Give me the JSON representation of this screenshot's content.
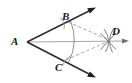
{
  "figure": {
    "background_color": "#ffffff",
    "width": 132,
    "height": 83,
    "stroke_color": "#2b2b2b",
    "construction_color": "#8a8a8a",
    "dashed_color": "#9a9a9a",
    "labels": {
      "vertex": "A",
      "upper_point": "B",
      "lower_point": "C",
      "intersection_point": "D"
    },
    "points": {
      "A": {
        "x": 27,
        "y": 42
      },
      "B": {
        "x": 68,
        "y": 22
      },
      "C": {
        "x": 66,
        "y": 60
      },
      "D": {
        "x": 109,
        "y": 40
      }
    },
    "rays": [
      {
        "name": "ray-AB",
        "from": "A",
        "through": "B",
        "tip_x": 95,
        "tip_y": 8,
        "arrow": true,
        "style": "solid"
      },
      {
        "name": "ray-AC",
        "from": "A",
        "through": "C",
        "tip_x": 95,
        "tip_y": 77,
        "arrow": true,
        "style": "solid"
      },
      {
        "name": "ray-AD-bisector",
        "from": "A",
        "through": "D",
        "tip_x": 129,
        "tip_y": 41,
        "arrow": true,
        "style": "solid-light"
      }
    ],
    "arcs": [
      {
        "name": "arc-BC-from-A",
        "description": "compass arc centered at A cutting the rays at B and C"
      },
      {
        "name": "arc-from-B",
        "description": "compass arc centered at B crossing near D"
      },
      {
        "name": "arc-from-C",
        "description": "compass arc centered at C crossing near D"
      },
      {
        "name": "tick-arc-at-B",
        "description": "short arc tick mark crossing ray AB at B"
      },
      {
        "name": "tick-arc-at-C",
        "description": "short arc tick mark crossing ray AC at C"
      }
    ],
    "dashed_segments": [
      {
        "name": "dashed-BD",
        "from": "B",
        "to": "D"
      },
      {
        "name": "dashed-CD",
        "from": "C",
        "to": "D"
      }
    ]
  }
}
